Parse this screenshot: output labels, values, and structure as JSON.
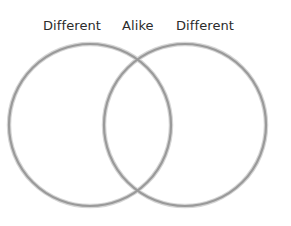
{
  "diagram": {
    "type": "venn",
    "labels": {
      "left": "Different",
      "middle": "Alike",
      "right": "Different"
    },
    "circles": [
      {
        "name": "left-circle",
        "cx": 90,
        "cy": 125,
        "r": 81
      },
      {
        "name": "right-circle",
        "cx": 185,
        "cy": 125,
        "r": 81
      }
    ],
    "colors": {
      "stroke": "#9a9a9a",
      "stroke_shadow": "#cfcfcf",
      "text": "#2b2b2b",
      "background": "#ffffff"
    }
  }
}
